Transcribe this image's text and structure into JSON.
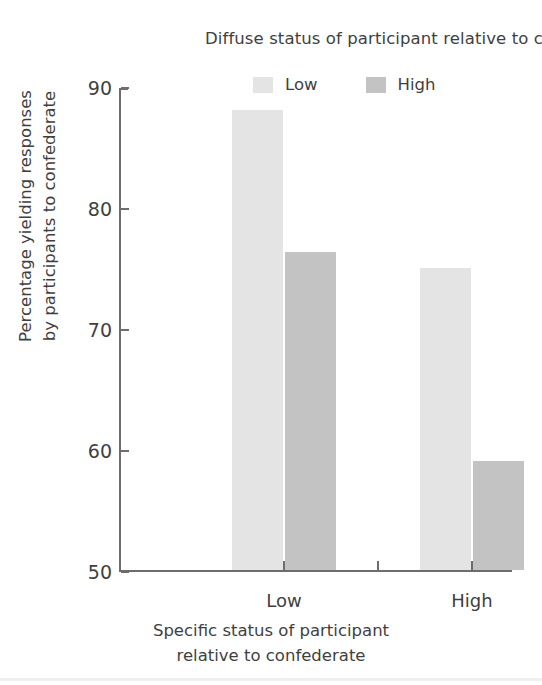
{
  "chart_data": {
    "type": "bar",
    "title": "",
    "categories": [
      "Low",
      "High"
    ],
    "series": [
      {
        "name": "Low",
        "values": [
          88,
          75
        ],
        "color": "#e4e4e4"
      },
      {
        "name": "High",
        "values": [
          76.3,
          59
        ],
        "color": "#c3c3c3"
      }
    ],
    "xlabel": "Specific status of participant\nrelative to confederate",
    "ylabel": "Percentage yielding responses\nby participants to confederate",
    "ylim": [
      50,
      90
    ],
    "yticks": [
      50,
      60,
      70,
      80,
      90
    ],
    "ytick_labels": [
      "50",
      "60",
      "70",
      "80",
      "90"
    ],
    "grid": false,
    "legend_position": "top-right"
  },
  "legend": {
    "title": "Diffuse status of participant\nrelative to confederate:",
    "entries": [
      {
        "label": "Low",
        "color": "#e4e4e4"
      },
      {
        "label": "High",
        "color": "#c3c3c3"
      }
    ]
  },
  "axes": {
    "y_title": "Percentage yielding responses\nby participants to confederate",
    "x_title": "Specific status of participant\nrelative to confederate",
    "y_tick_labels": [
      "90",
      "80",
      "70",
      "60",
      "50"
    ],
    "x_tick_labels": [
      "Low",
      "High"
    ],
    "axis_color": "#6d6d6d"
  }
}
